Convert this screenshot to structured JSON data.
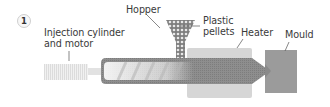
{
  "figure": {
    "step_number": "1",
    "labels": {
      "injection": [
        "Injection cylinder",
        "and motor"
      ],
      "hopper": "Hopper",
      "pellets": [
        "Plastic",
        "pellets"
      ],
      "heater": "Heater",
      "mould": "Mould"
    },
    "colors": {
      "barrel": "#8c8c8c",
      "heater": "#d4d4d4",
      "mould": "#9a9a9a",
      "motor": "#e6e6e6",
      "screw": "#f4f4f4",
      "hopper": "#8a8a8a",
      "leader": "#555555",
      "text": "#3a3a3a"
    }
  }
}
